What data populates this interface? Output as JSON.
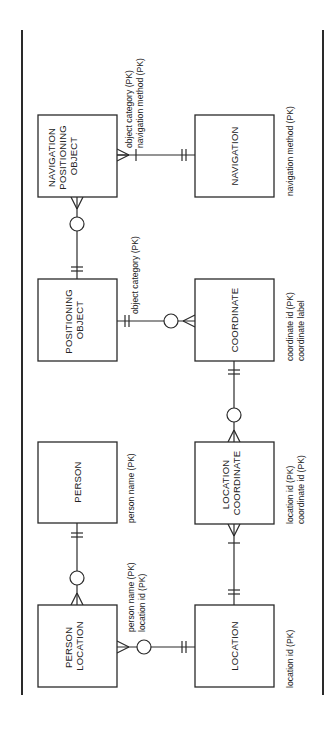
{
  "diagram": {
    "type": "entity-relationship",
    "notation": "crow's foot",
    "orientation": "rotated 90deg counter-clockwise",
    "colors": {
      "line": "#2a2a2a",
      "background": "#ffffff"
    },
    "entities": {
      "navigation_positioning_object": {
        "lines": [
          "NAVIGATION",
          "POSITIONING",
          "OBJECT"
        ],
        "attributes": [
          "object category (PK)",
          "navigation method (PK)"
        ]
      },
      "navigation": {
        "lines": [
          "NAVIGATION"
        ],
        "attributes": [
          "navigation method (PK)"
        ]
      },
      "positioning_object": {
        "lines": [
          "POSITIONING",
          "OBJECT"
        ],
        "attributes": [
          "object category (PK)"
        ]
      },
      "coordinate": {
        "lines": [
          "COORDINATE"
        ],
        "attributes": [
          "coordinate id (PK)",
          "coordinate label"
        ]
      },
      "person": {
        "lines": [
          "PERSON"
        ],
        "attributes": [
          "person name (PK)"
        ]
      },
      "location_coordinate": {
        "lines": [
          "LOCATION",
          "COORDINATE"
        ],
        "attributes": [
          "location id (PK)",
          "coordinate id (PK)"
        ]
      },
      "person_location": {
        "lines": [
          "PERSON",
          "LOCATION"
        ],
        "attributes": [
          "person name (PK)",
          "location id (PK)"
        ]
      },
      "location": {
        "lines": [
          "LOCATION"
        ],
        "attributes": [
          "location id (PK)"
        ]
      }
    },
    "relationships": [
      {
        "from": "navigation",
        "to": "navigation_positioning_object",
        "from_card": "exactly one",
        "to_card": "one or many"
      },
      {
        "from": "positioning_object",
        "to": "navigation_positioning_object",
        "from_card": "exactly one",
        "to_card": "zero or many"
      },
      {
        "from": "positioning_object",
        "to": "coordinate",
        "from_card": "exactly one",
        "to_card": "zero or many"
      },
      {
        "from": "coordinate",
        "to": "location_coordinate",
        "from_card": "exactly one",
        "to_card": "zero or many"
      },
      {
        "from": "location",
        "to": "location_coordinate",
        "from_card": "exactly one",
        "to_card": "one or many"
      },
      {
        "from": "person",
        "to": "person_location",
        "from_card": "exactly one",
        "to_card": "zero or many"
      },
      {
        "from": "location",
        "to": "person_location",
        "from_card": "exactly one",
        "to_card": "zero or many"
      }
    ]
  }
}
